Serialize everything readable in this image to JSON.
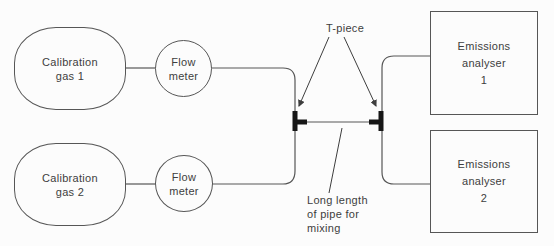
{
  "nodes": {
    "calibration_gas_1": "Calibration\ngas 1",
    "flow_meter_1": "Flow\nmeter",
    "calibration_gas_2": "Calibration\ngas 2",
    "flow_meter_2": "Flow\nmeter",
    "emissions_analyser_1": "Emissions\nanalyser\n1",
    "emissions_analyser_2": "Emissions\nanalyser\n2"
  },
  "annotations": {
    "t_piece": "T-piece",
    "mixing_pipe": "Long length\nof pipe for\nmixing"
  },
  "colors": {
    "line": "#565656",
    "text": "#3e3e3e",
    "junction": "#161616",
    "background": "#fcfcfc"
  }
}
